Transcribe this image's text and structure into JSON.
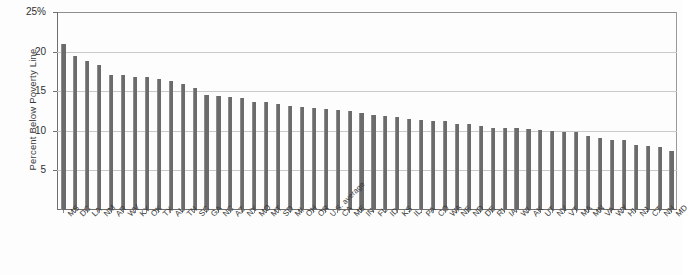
{
  "chart_data": {
    "type": "bar",
    "title": "",
    "xlabel": "",
    "ylabel": "Percent Below Poverty Line",
    "ylim": [
      0,
      25
    ],
    "yticks": [
      5,
      10,
      15,
      20,
      25
    ],
    "ytick_labels": [
      "5",
      "10",
      "15",
      "20",
      "25%"
    ],
    "grid": true,
    "legend": "none",
    "bar_color": "#6b6b6b",
    "categories": [
      "MS",
      "DC",
      "LA",
      "NM",
      "AR",
      "WV",
      "KY",
      "OK",
      "TX",
      "AL",
      "TN",
      "SC",
      "GA",
      "NC",
      "AZ",
      "NY",
      "MO",
      "MT",
      "SD",
      "MI",
      "OH",
      "OR",
      "U.S. average",
      "CA",
      "ME",
      "IN",
      "FL",
      "ID",
      "KS",
      "IL",
      "PA",
      "CO",
      "WA",
      "NE",
      "ND",
      "DE",
      "RI",
      "IA",
      "WI",
      "AK",
      "UT",
      "NV",
      "VT",
      "MA",
      "MN",
      "VA",
      "WY",
      "HI",
      "NJ",
      "CT",
      "NH",
      "MD"
    ],
    "values": [
      20.9,
      19.4,
      18.8,
      18.3,
      17.1,
      17.1,
      16.8,
      16.8,
      16.6,
      16.3,
      15.9,
      15.4,
      14.5,
      14.4,
      14.3,
      14.2,
      13.7,
      13.6,
      13.4,
      13.1,
      13.0,
      12.9,
      12.7,
      12.6,
      12.5,
      12.2,
      12.0,
      11.9,
      11.8,
      11.5,
      11.4,
      11.3,
      11.2,
      10.9,
      10.8,
      10.6,
      10.4,
      10.4,
      10.3,
      10.2,
      10.1,
      10.0,
      9.9,
      9.8,
      9.4,
      9.1,
      8.9,
      8.8,
      8.2,
      8.1,
      7.9,
      7.4
    ]
  }
}
